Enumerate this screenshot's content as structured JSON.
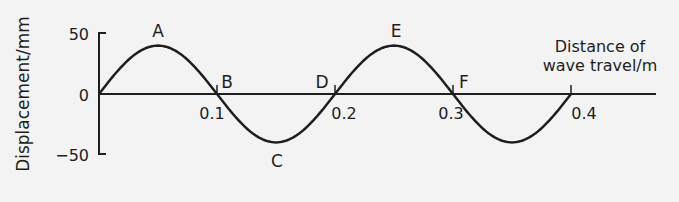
{
  "chart_data": {
    "type": "line",
    "title": "",
    "xlabel": "Distance of wave travel/m",
    "xlabel_lines": [
      "Distance of",
      "wave travel/m"
    ],
    "ylabel": "Displacement/mm",
    "xlim": [
      0,
      0.47
    ],
    "ylim": [
      -50,
      50
    ],
    "x_ticks": [
      0.1,
      0.2,
      0.3,
      0.4
    ],
    "x_tick_labels": [
      "0.1",
      "0.2",
      "0.3",
      "0.4"
    ],
    "y_ticks": [
      50,
      0,
      -50
    ],
    "y_tick_labels": [
      "50",
      "0",
      "−50"
    ],
    "grid": false,
    "legend": null,
    "series": [
      {
        "name": "wave",
        "function": "40*sin(2*pi*x/0.2)",
        "amplitude_mm": 40,
        "wavelength_m": 0.2,
        "x_range": [
          0,
          0.4
        ],
        "x": [
          0,
          0.05,
          0.1,
          0.15,
          0.2,
          0.25,
          0.3,
          0.35,
          0.4
        ],
        "y": [
          0,
          40,
          0,
          -40,
          0,
          40,
          0,
          -40,
          0
        ]
      }
    ],
    "annotations": [
      {
        "label": "A",
        "x": 0.05,
        "y": 40
      },
      {
        "label": "B",
        "x": 0.1,
        "y": 0
      },
      {
        "label": "C",
        "x": 0.15,
        "y": -40
      },
      {
        "label": "D",
        "x": 0.2,
        "y": 0
      },
      {
        "label": "E",
        "x": 0.25,
        "y": 40
      },
      {
        "label": "F",
        "x": 0.3,
        "y": 0
      }
    ]
  },
  "colors": {
    "background": "#f3f3f3",
    "ink": "#1e1e1e"
  }
}
